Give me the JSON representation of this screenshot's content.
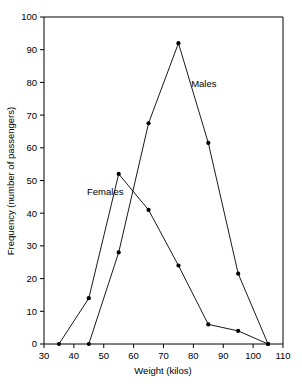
{
  "chart_data": {
    "type": "line",
    "title": "",
    "xlabel": "Weight (kilos)",
    "ylabel": "Frequency (number of passengers)",
    "xlim": [
      30,
      110
    ],
    "ylim": [
      0,
      100
    ],
    "xticks": [
      30,
      40,
      50,
      60,
      70,
      80,
      90,
      100,
      110
    ],
    "xtick_labels": [
      "30",
      "40",
      "50",
      "60",
      "70",
      "80",
      "90",
      "100",
      "110"
    ],
    "yticks": [
      0,
      10,
      20,
      30,
      40,
      50,
      60,
      70,
      80,
      90,
      100
    ],
    "ytick_labels": [
      "0",
      "10",
      "20",
      "30",
      "40",
      "50",
      "60",
      "70",
      "80",
      "90",
      "100"
    ],
    "grid": false,
    "legend_position": "inline-annotation",
    "marker": "filled-circle",
    "line_color": "#000000",
    "series": [
      {
        "name": "Females",
        "label_text": "Females",
        "x": [
          35,
          45,
          55,
          65,
          75,
          85,
          95,
          105
        ],
        "values": [
          0,
          14,
          52,
          41,
          24,
          6,
          4,
          0
        ]
      },
      {
        "name": "Males",
        "label_text": "Males",
        "x": [
          45,
          55,
          65,
          75,
          85,
          95,
          105
        ],
        "values": [
          0,
          28,
          67.5,
          92,
          61.5,
          21.5,
          0
        ]
      }
    ],
    "annotations": [
      {
        "text": "Females",
        "x": 50.5,
        "y": 45.5
      },
      {
        "text": "Males",
        "x": 83.5,
        "y": 78.5
      }
    ]
  }
}
